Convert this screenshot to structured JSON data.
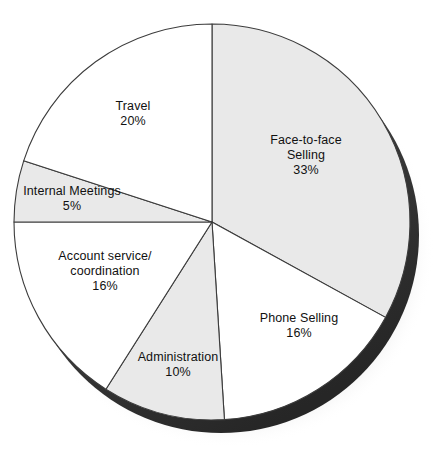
{
  "chart_data": {
    "type": "pie",
    "title": "",
    "subtitle": "",
    "xlabel": "",
    "ylabel": "",
    "legend_position": "none",
    "grid": false,
    "label_format": "name + percent",
    "start_angle_deg": 0,
    "direction": "clockwise",
    "categories": [
      "Face-to-face Selling",
      "Phone Selling",
      "Administration",
      "Account service/ coordination",
      "Internal Meetings",
      "Travel"
    ],
    "values": [
      33,
      16,
      10,
      16,
      5,
      20
    ],
    "units": "%",
    "slices": [
      {
        "name": "Face-to-face Selling",
        "label_line1": "Face-to-face",
        "label_line2": "Selling",
        "value": 33,
        "value_text": "33%",
        "fill": "#e9e9e9",
        "start_pct": 0,
        "end_pct": 33
      },
      {
        "name": "Phone Selling",
        "label_line1": "Phone Selling",
        "label_line2": "",
        "value": 16,
        "value_text": "16%",
        "fill": "#ffffff",
        "start_pct": 33,
        "end_pct": 49
      },
      {
        "name": "Administration",
        "label_line1": "Administration",
        "label_line2": "",
        "value": 10,
        "value_text": "10%",
        "fill": "#e9e9e9",
        "start_pct": 49,
        "end_pct": 59
      },
      {
        "name": "Account service/ coordination",
        "label_line1": "Account service/",
        "label_line2": "coordination",
        "value": 16,
        "value_text": "16%",
        "fill": "#ffffff",
        "start_pct": 59,
        "end_pct": 75
      },
      {
        "name": "Internal Meetings",
        "label_line1": "Internal Meetings",
        "label_line2": "",
        "value": 5,
        "value_text": "5%",
        "fill": "#e9e9e9",
        "start_pct": 75,
        "end_pct": 80
      },
      {
        "name": "Travel",
        "label_line1": "Travel",
        "label_line2": "",
        "value": 20,
        "value_text": "20%",
        "fill": "#ffffff",
        "start_pct": 80,
        "end_pct": 100
      }
    ],
    "colors": {
      "shaded_slice": "#e9e9e9",
      "plain_slice": "#ffffff",
      "outline": "#3c3c3c",
      "rim_3d": "#333333",
      "drop_shadow": "#9a9a9a",
      "background": "#ffffff",
      "label_text": "#111111"
    }
  }
}
